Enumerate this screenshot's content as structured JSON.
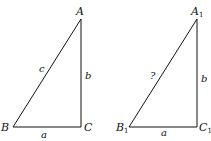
{
  "figure": {
    "triangle_1": {
      "vertices": {
        "A": "A",
        "B": "B",
        "C": "C"
      },
      "sides": {
        "hypotenuse": "c",
        "vertical": "b",
        "horizontal": "a"
      }
    },
    "triangle_2": {
      "vertices": {
        "A": "A",
        "A_sub": "1",
        "B": "B",
        "B_sub": "1",
        "C": "C",
        "C_sub": "1"
      },
      "sides": {
        "hypotenuse": "?",
        "vertical": "b",
        "horizontal": "a"
      }
    },
    "line_color": "#111111"
  }
}
